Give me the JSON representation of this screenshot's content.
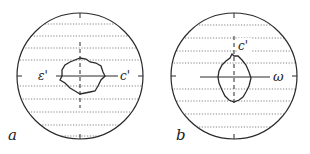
{
  "figure": {
    "panels": [
      {
        "id": "a",
        "label": "a",
        "axis_labels": {
          "left": "ε'",
          "right": "c'"
        },
        "orientation": "horizontal section: solid axis horizontal (ε'–c'), dashed axis vertical"
      },
      {
        "id": "b",
        "label": "b",
        "axis_labels": {
          "top": "c'",
          "right": "ω"
        },
        "orientation": "solid axis horizontal (ω), dashed axis vertical (c')"
      }
    ],
    "colors": {
      "stroke": "#2a2a2a",
      "hatch": "#555555",
      "background": "#ffffff"
    }
  }
}
